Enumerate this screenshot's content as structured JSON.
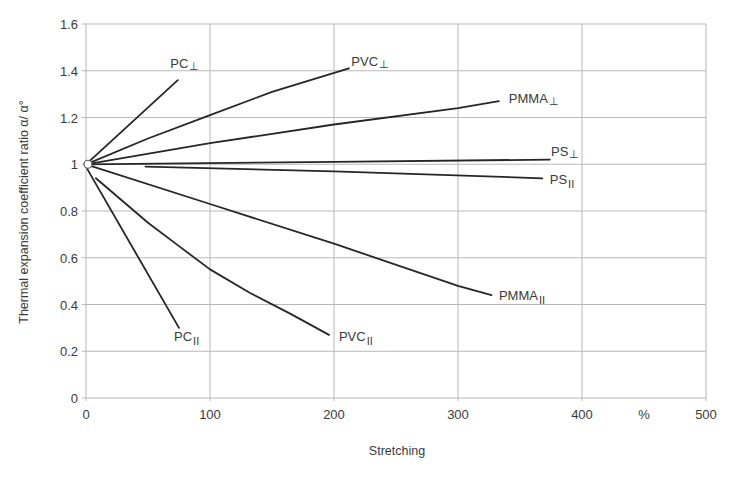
{
  "chart_data": {
    "type": "line",
    "title": "",
    "xlabel": "Stretching",
    "xunit": "%",
    "ylabel": "Thermal expansion coefficient ratio α/ α°",
    "xlim": [
      0,
      500
    ],
    "ylim": [
      0,
      1.6
    ],
    "grid": true,
    "legend": "inline labels at line ends",
    "x_ticks": [
      "0",
      "100",
      "200",
      "300",
      "400",
      "500"
    ],
    "x_tick_values": [
      0,
      100,
      200,
      300,
      400,
      500
    ],
    "y_ticks": [
      "0",
      "0.2",
      "0.4",
      "0.6",
      "0.8",
      "1",
      "1.2",
      "1.4",
      "1.6"
    ],
    "y_tick_values": [
      0,
      0.2,
      0.4,
      0.6,
      0.8,
      1.0,
      1.2,
      1.4,
      1.6
    ],
    "origin_marker": {
      "x": 0,
      "y": 1.0
    },
    "series": [
      {
        "name": "PC⊥",
        "base": "PC",
        "sub": "⊥",
        "points": [
          [
            0,
            1.0
          ],
          [
            74,
            1.36
          ]
        ],
        "label_pos": [
          68,
          1.41
        ]
      },
      {
        "name": "PVC⊥",
        "base": "PVC",
        "sub": "⊥",
        "points": [
          [
            0,
            1.0
          ],
          [
            50,
            1.11
          ],
          [
            100,
            1.21
          ],
          [
            150,
            1.31
          ],
          [
            212,
            1.41
          ]
        ],
        "label_pos": [
          214,
          1.42
        ]
      },
      {
        "name": "PMMA⊥",
        "base": "PMMA",
        "sub": "⊥",
        "points": [
          [
            0,
            1.0
          ],
          [
            100,
            1.09
          ],
          [
            200,
            1.17
          ],
          [
            300,
            1.24
          ],
          [
            333,
            1.27
          ]
        ],
        "label_pos": [
          341,
          1.26
        ]
      },
      {
        "name": "PS⊥",
        "base": "PS",
        "sub": "⊥",
        "points": [
          [
            0,
            1.0
          ],
          [
            200,
            1.01
          ],
          [
            374,
            1.02
          ]
        ],
        "label_pos": [
          375,
          1.035
        ]
      },
      {
        "name": "PS∥",
        "base": "PS",
        "sub": "II",
        "points": [
          [
            48,
            0.99
          ],
          [
            200,
            0.97
          ],
          [
            368,
            0.94
          ]
        ],
        "label_pos": [
          374,
          0.915
        ]
      },
      {
        "name": "PMMA∥",
        "base": "PMMA",
        "sub": "II",
        "points": [
          [
            0,
            1.0
          ],
          [
            100,
            0.83
          ],
          [
            200,
            0.66
          ],
          [
            300,
            0.48
          ],
          [
            327,
            0.44
          ]
        ],
        "label_pos": [
          333,
          0.42
        ]
      },
      {
        "name": "PVC∥",
        "base": "PVC",
        "sub": "II",
        "points": [
          [
            8,
            0.94
          ],
          [
            50,
            0.75
          ],
          [
            75,
            0.65
          ],
          [
            100,
            0.55
          ],
          [
            132,
            0.45
          ],
          [
            165,
            0.36
          ],
          [
            196,
            0.27
          ]
        ],
        "label_pos": [
          204,
          0.245
        ]
      },
      {
        "name": "PC∥",
        "base": "PC",
        "sub": "II",
        "points": [
          [
            1,
            0.98
          ],
          [
            75,
            0.3
          ]
        ],
        "label_pos": [
          71,
          0.245
        ]
      }
    ]
  }
}
